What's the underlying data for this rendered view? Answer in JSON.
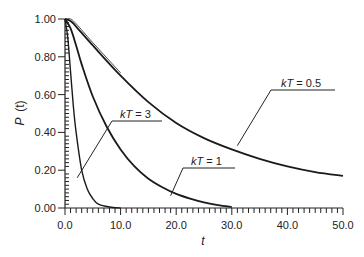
{
  "chart_data": {
    "type": "line",
    "title": "",
    "xlabel": "t",
    "ylabel": "P (t)",
    "xlim": [
      0,
      50
    ],
    "ylim": [
      0,
      1
    ],
    "grid": false,
    "legend": "inline annotations",
    "x_ticks": [
      "0.0",
      "10.0",
      "20.0",
      "30.0",
      "40.0",
      "50.0"
    ],
    "y_ticks": [
      "0.00",
      "0.20",
      "0.40",
      "0.60",
      "0.80",
      "1.00"
    ],
    "series": [
      {
        "name": "kT = 0.5",
        "x": [
          0,
          1,
          2,
          5,
          10,
          15,
          20,
          25,
          30,
          35,
          40,
          45,
          50
        ],
        "values": [
          1.0,
          0.99,
          0.96,
          0.86,
          0.7,
          0.56,
          0.45,
          0.37,
          0.31,
          0.26,
          0.22,
          0.19,
          0.17
        ],
        "label_anchor": {
          "x": 31,
          "y": 0.33
        }
      },
      {
        "name": "kT = 1",
        "x": [
          0,
          1,
          2,
          3,
          5,
          7.5,
          10,
          12.5,
          15,
          17.5,
          20,
          22.5,
          25,
          27.5,
          30
        ],
        "values": [
          1.0,
          0.95,
          0.86,
          0.76,
          0.59,
          0.43,
          0.31,
          0.22,
          0.155,
          0.11,
          0.075,
          0.05,
          0.03,
          0.015,
          0.005
        ],
        "label_anchor": {
          "x": 19,
          "y": 0.065
        }
      },
      {
        "name": "kT = 3",
        "x": [
          0,
          0.5,
          1,
          1.5,
          2,
          3,
          4,
          5,
          6,
          8,
          10
        ],
        "values": [
          1.0,
          0.9,
          0.72,
          0.54,
          0.4,
          0.2,
          0.1,
          0.05,
          0.02,
          0.005,
          0.0
        ],
        "label_anchor": {
          "x": 2.2,
          "y": 0.16
        }
      }
    ],
    "annotations": [
      {
        "text": "kT = 0.5",
        "series": "kT = 0.5"
      },
      {
        "text": "kT = 1",
        "series": "kT = 1"
      },
      {
        "text": "kT = 3",
        "series": "kT = 3"
      }
    ]
  },
  "labels": {
    "xlabel": "t",
    "ylabel_p": "P",
    "ylabel_t": "(t)"
  }
}
